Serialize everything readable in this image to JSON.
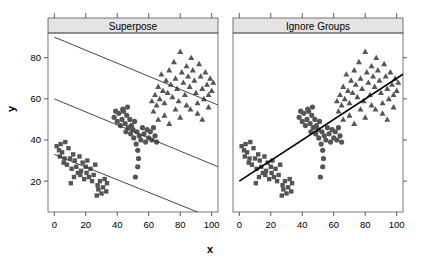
{
  "figure": {
    "xlabel": "x",
    "ylabel": "y",
    "panels": [
      {
        "id": "superpose",
        "title": "Superpose"
      },
      {
        "id": "ignore",
        "title": "Ignore Groups"
      }
    ]
  },
  "chart_data": {
    "type": "scatter",
    "title": "",
    "xlabel": "x",
    "ylabel": "y",
    "xlim": [
      -4,
      104
    ],
    "ylim": [
      5,
      92
    ],
    "xticks": [
      0,
      20,
      40,
      60,
      80,
      100
    ],
    "yticks": [
      20,
      40,
      60,
      80
    ],
    "grid": false,
    "legend": "none",
    "marker_color": "#555555",
    "line_color": "#333333",
    "pooled_line_color": "#000000",
    "panels": [
      {
        "name": "Superpose",
        "description": "Separate regression line fitted within each group; all three slopes negative",
        "fit_lines": [
          {
            "group": "Group 3 (triangle)",
            "x1": 0,
            "y1": 90,
            "x2": 104,
            "y2": 57,
            "slope": -0.317,
            "intercept": 90
          },
          {
            "group": "Group 2 (circle)",
            "x1": 0,
            "y1": 60,
            "x2": 104,
            "y2": 27,
            "slope": -0.317,
            "intercept": 60
          },
          {
            "group": "Group 1 (square)",
            "x1": 0,
            "y1": 33,
            "x2": 104,
            "y2": 1,
            "slope": -0.308,
            "intercept": 33
          }
        ]
      },
      {
        "name": "Ignore Groups",
        "description": "Single regression line fitted to pooled data; slope positive (Simpson's paradox)",
        "fit_lines": [
          {
            "group": "Pooled",
            "x1": 0,
            "y1": 20,
            "x2": 104,
            "y2": 72,
            "slope": 0.5,
            "intercept": 20
          }
        ]
      }
    ],
    "series": [
      {
        "name": "Group 1",
        "marker": "square",
        "points": [
          [
            1.5,
            37
          ],
          [
            3,
            35
          ],
          [
            3.5,
            32
          ],
          [
            4,
            38
          ],
          [
            5,
            34
          ],
          [
            6,
            29
          ],
          [
            7,
            39
          ],
          [
            8,
            28
          ],
          [
            9,
            36
          ],
          [
            10,
            31
          ],
          [
            11,
            26
          ],
          [
            12,
            33
          ],
          [
            12.5,
            22
          ],
          [
            13,
            30
          ],
          [
            14,
            27
          ],
          [
            15,
            24
          ],
          [
            16,
            32
          ],
          [
            17,
            25
          ],
          [
            18,
            29
          ],
          [
            19,
            21
          ],
          [
            20,
            27
          ],
          [
            20.5,
            24
          ],
          [
            21,
            30
          ],
          [
            22,
            22
          ],
          [
            23,
            26
          ],
          [
            24,
            20
          ],
          [
            25,
            23
          ],
          [
            26,
            28
          ],
          [
            27,
            13
          ],
          [
            27.5,
            18
          ],
          [
            28,
            16
          ],
          [
            29,
            20
          ],
          [
            30,
            14
          ],
          [
            31,
            17
          ],
          [
            32,
            21
          ],
          [
            33,
            15
          ],
          [
            33.5,
            19
          ],
          [
            10.5,
            19
          ],
          [
            6.5,
            31
          ],
          [
            16.5,
            23
          ]
        ]
      },
      {
        "name": "Group 2",
        "marker": "circle",
        "points": [
          [
            38,
            51
          ],
          [
            40,
            49
          ],
          [
            41,
            53
          ],
          [
            42,
            47
          ],
          [
            43,
            50
          ],
          [
            44,
            54
          ],
          [
            45,
            48
          ],
          [
            45.5,
            44
          ],
          [
            46,
            52
          ],
          [
            47,
            46
          ],
          [
            48,
            50
          ],
          [
            48.5,
            43
          ],
          [
            49,
            47
          ],
          [
            50,
            45
          ],
          [
            50.5,
            41
          ],
          [
            51,
            49
          ],
          [
            52,
            38
          ],
          [
            52.5,
            44
          ],
          [
            53,
            35
          ],
          [
            53.5,
            31
          ],
          [
            54,
            42
          ],
          [
            55,
            40
          ],
          [
            56,
            46
          ],
          [
            57,
            43
          ],
          [
            58,
            39
          ],
          [
            59,
            45
          ],
          [
            60,
            41
          ],
          [
            61,
            44
          ],
          [
            62,
            40
          ],
          [
            63,
            46
          ],
          [
            64,
            42
          ],
          [
            65,
            39
          ],
          [
            46.5,
            56
          ],
          [
            43.5,
            55
          ],
          [
            39,
            54
          ],
          [
            51.5,
            22
          ],
          [
            53,
            27
          ]
        ]
      },
      {
        "name": "Group 3",
        "marker": "triangle",
        "points": [
          [
            62,
            59
          ],
          [
            64,
            62
          ],
          [
            65,
            57
          ],
          [
            66,
            66
          ],
          [
            67,
            60
          ],
          [
            68,
            72
          ],
          [
            69,
            64
          ],
          [
            70,
            58
          ],
          [
            71,
            69
          ],
          [
            72,
            63
          ],
          [
            73,
            74
          ],
          [
            74,
            67
          ],
          [
            75,
            61
          ],
          [
            76,
            78
          ],
          [
            77,
            70
          ],
          [
            78,
            65
          ],
          [
            79,
            59
          ],
          [
            80,
            83
          ],
          [
            81,
            73
          ],
          [
            82,
            68
          ],
          [
            83,
            62
          ],
          [
            84,
            76
          ],
          [
            85,
            71
          ],
          [
            86,
            66
          ],
          [
            86.5,
            55
          ],
          [
            87,
            80
          ],
          [
            88,
            74
          ],
          [
            89,
            69
          ],
          [
            90,
            63
          ],
          [
            91,
            58
          ],
          [
            92,
            77
          ],
          [
            93,
            71
          ],
          [
            94,
            65
          ],
          [
            95,
            60
          ],
          [
            96,
            73
          ],
          [
            97,
            67
          ],
          [
            98,
            62
          ],
          [
            99,
            70
          ],
          [
            100,
            64
          ],
          [
            101,
            68
          ],
          [
            63,
            54
          ],
          [
            70,
            52
          ],
          [
            77,
            55
          ],
          [
            84,
            57
          ],
          [
            91,
            53
          ],
          [
            98,
            56
          ],
          [
            66,
            50
          ],
          [
            80,
            51
          ],
          [
            73,
            48
          ],
          [
            94,
            50
          ]
        ]
      }
    ]
  }
}
